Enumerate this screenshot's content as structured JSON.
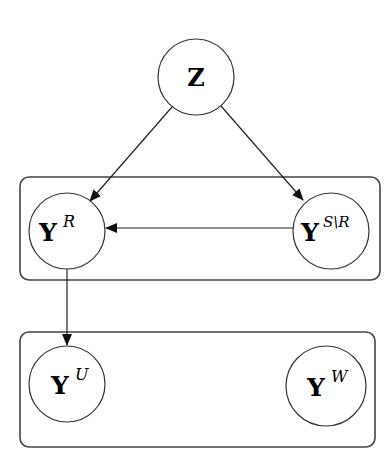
{
  "diagram": {
    "type": "graphical-model",
    "colors": {
      "stroke": "#333333",
      "background": "#ffffff"
    },
    "nodes": [
      {
        "id": "Z",
        "base": "Z",
        "sup": "",
        "cx": 196,
        "cy": 77,
        "r": 38
      },
      {
        "id": "YR",
        "base": "Y",
        "sup": "R",
        "cx": 67,
        "cy": 231,
        "r": 38
      },
      {
        "id": "YSR",
        "base": "Y",
        "sup": "S\\R",
        "cx": 331,
        "cy": 231,
        "r": 38
      },
      {
        "id": "YU",
        "base": "Y",
        "sup": "U",
        "cx": 67,
        "cy": 384,
        "r": 38
      },
      {
        "id": "YW",
        "base": "Y",
        "sup": "W",
        "cx": 326,
        "cy": 386,
        "r": 40
      }
    ],
    "plates": [
      {
        "id": "top-plate",
        "contains": [
          "YR",
          "YSR"
        ]
      },
      {
        "id": "bottom-plate",
        "contains": [
          "YU",
          "YW"
        ]
      }
    ],
    "edges": [
      {
        "from": "Z",
        "to": "YR"
      },
      {
        "from": "Z",
        "to": "YSR"
      },
      {
        "from": "YSR",
        "to": "YR"
      },
      {
        "from": "YR",
        "to": "YU"
      }
    ]
  }
}
